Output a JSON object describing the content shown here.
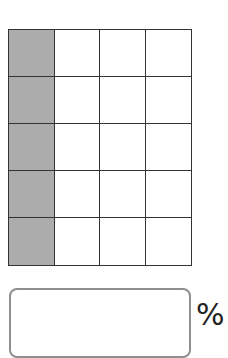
{
  "grid": {
    "rows": 5,
    "columns": 4,
    "shaded_column": 0,
    "shaded_cells": 5,
    "total_cells": 20,
    "shade_color": "#c9c9c9",
    "line_color": "#333333"
  },
  "answer": {
    "value": "",
    "unit": "%"
  }
}
